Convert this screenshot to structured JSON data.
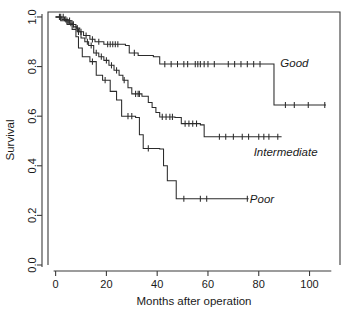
{
  "chart_data": {
    "type": "line",
    "subtype": "kaplan-meier-step",
    "title": "",
    "xlabel": "Months after operation",
    "ylabel": "Survival",
    "xlim": [
      -3,
      112
    ],
    "ylim": [
      0.0,
      1.02
    ],
    "xticks": [
      0,
      20,
      40,
      60,
      80,
      100
    ],
    "xticklabels": [
      "0",
      "20",
      "40",
      "60",
      "80",
      "100"
    ],
    "yticks": [
      0.0,
      0.2,
      0.4,
      0.6,
      0.8,
      1.0
    ],
    "yticklabels": [
      "0.0",
      "0.2",
      "0.4",
      "0.6",
      "0.8",
      "1.0"
    ],
    "grid": false,
    "legend": "inline-labels-right",
    "series": [
      {
        "name": "Good",
        "label": "Good",
        "label_x": 88.5,
        "label_y": 0.815,
        "color": "#2b2b2b",
        "steps": [
          [
            0,
            1.0
          ],
          [
            3.5,
            0.985
          ],
          [
            6.5,
            0.97
          ],
          [
            8.0,
            0.955
          ],
          [
            9.5,
            0.94
          ],
          [
            11.0,
            0.925
          ],
          [
            13.5,
            0.91
          ],
          [
            15.5,
            0.9
          ],
          [
            19.0,
            0.89
          ],
          [
            27.5,
            0.885
          ],
          [
            29.0,
            0.855
          ],
          [
            32.5,
            0.845
          ],
          [
            38.5,
            0.84
          ],
          [
            41.0,
            0.81
          ],
          [
            86.0,
            0.81
          ],
          [
            86.0,
            0.645
          ],
          [
            106.5,
            0.645
          ]
        ],
        "censor_times": [
          2.0,
          3.0,
          4.5,
          5.5,
          7.0,
          8.5,
          10.0,
          12.0,
          14.5,
          17.0,
          20.5,
          21.5,
          22.5,
          23.5,
          24.5,
          31.0,
          43.0,
          45.5,
          48.0,
          50.5,
          52.0,
          55.0,
          56.0,
          57.0,
          58.5,
          60.0,
          62.5,
          68.0,
          70.5,
          73.0,
          75.5,
          78.0,
          80.5,
          90.5,
          94.0,
          99.5,
          106.0
        ],
        "plateau_value": 0.81,
        "final_value": 0.645
      },
      {
        "name": "Intermediate",
        "label": "Intermediate",
        "label_x": 78.0,
        "label_y": 0.455,
        "color": "#2b2b2b",
        "steps": [
          [
            0,
            1.0
          ],
          [
            2.5,
            0.99
          ],
          [
            5.0,
            0.975
          ],
          [
            7.0,
            0.96
          ],
          [
            8.5,
            0.94
          ],
          [
            10.0,
            0.915
          ],
          [
            11.5,
            0.9
          ],
          [
            13.0,
            0.885
          ],
          [
            15.0,
            0.855
          ],
          [
            17.0,
            0.84
          ],
          [
            19.0,
            0.825
          ],
          [
            21.0,
            0.805
          ],
          [
            23.0,
            0.785
          ],
          [
            25.0,
            0.765
          ],
          [
            26.5,
            0.745
          ],
          [
            28.5,
            0.715
          ],
          [
            30.0,
            0.69
          ],
          [
            34.0,
            0.68
          ],
          [
            36.5,
            0.655
          ],
          [
            38.0,
            0.635
          ],
          [
            39.5,
            0.615
          ],
          [
            41.0,
            0.597
          ],
          [
            47.0,
            0.595
          ],
          [
            49.5,
            0.57
          ],
          [
            57.0,
            0.565
          ],
          [
            58.5,
            0.517
          ],
          [
            89.0,
            0.517
          ]
        ],
        "censor_times": [
          1.5,
          4.0,
          6.0,
          9.0,
          12.5,
          14.0,
          16.0,
          18.0,
          20.0,
          22.0,
          24.0,
          27.0,
          31.5,
          32.5,
          33.0,
          42.0,
          43.5,
          45.0,
          46.0,
          51.0,
          52.5,
          54.0,
          55.5,
          64.5,
          67.0,
          70.0,
          73.5,
          76.0,
          80.0,
          82.0,
          84.0,
          87.5
        ],
        "plateau_value": 0.517,
        "final_value": 0.517
      },
      {
        "name": "Poor",
        "label": "Poor",
        "label_x": 76.5,
        "label_y": 0.268,
        "color": "#2b2b2b",
        "steps": [
          [
            0,
            1.0
          ],
          [
            2.0,
            0.985
          ],
          [
            4.5,
            0.97
          ],
          [
            6.5,
            0.95
          ],
          [
            8.0,
            0.92
          ],
          [
            9.0,
            0.875
          ],
          [
            10.5,
            0.84
          ],
          [
            13.5,
            0.82
          ],
          [
            16.0,
            0.765
          ],
          [
            18.5,
            0.745
          ],
          [
            21.5,
            0.7
          ],
          [
            24.0,
            0.665
          ],
          [
            26.0,
            0.6
          ],
          [
            31.5,
            0.595
          ],
          [
            33.0,
            0.525
          ],
          [
            34.5,
            0.47
          ],
          [
            41.0,
            0.468
          ],
          [
            42.5,
            0.4
          ],
          [
            44.0,
            0.34
          ],
          [
            47.5,
            0.267
          ],
          [
            76.0,
            0.267
          ]
        ],
        "censor_times": [
          14.5,
          19.5,
          28.5,
          30.0,
          36.5,
          50.5,
          57.0,
          59.5,
          75.5
        ],
        "plateau_value": 0.267,
        "final_value": 0.267
      }
    ]
  },
  "axes": {
    "x_title": "Months after operation",
    "y_title": "Survival"
  },
  "style": {
    "line_color": "#2b2b2b",
    "axis_color": "#3b3b3b",
    "background": "#ffffff",
    "text_color": "#1a1a1a"
  }
}
